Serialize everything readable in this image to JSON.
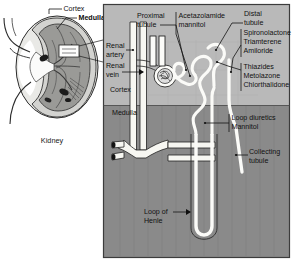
{
  "figure": {
    "type": "anatomical-diagram"
  },
  "kidney_panel": {
    "caption": "Kidney",
    "labels": {
      "cortex": "Cortex",
      "medulla": "Medulla"
    }
  },
  "nephron_panel": {
    "zones": {
      "cortex": "Cortex",
      "medulla": "Medulla"
    },
    "structures": {
      "proximal_tubule": "Proximal\ntubule",
      "proximal_tubule_line1": "Proximal",
      "proximal_tubule_line2": "tubule",
      "distal_tubule_line1": "Distal",
      "distal_tubule_line2": "tubule",
      "renal_artery_line1": "Renal",
      "renal_artery_line2": "artery",
      "renal_vein_line1": "Renal",
      "renal_vein_line2": "vein",
      "collecting_tubule_line1": "Collecting",
      "collecting_tubule_line2": "tubule",
      "loop_of_henle_line1": "Loop of",
      "loop_of_henle_line2": "Henle"
    },
    "drug_groups": [
      {
        "site": "proximal-tubule",
        "drugs": [
          "Acetazolamide",
          "mannitol"
        ],
        "line1": "Acetazolamide",
        "line2": "mannitol"
      },
      {
        "site": "collecting-duct",
        "drugs": [
          "Spironolactone",
          "Triamterene",
          "Amiloride"
        ],
        "line1": "Spironolactone",
        "line2": "Triamterene",
        "line3": "Amiloride"
      },
      {
        "site": "distal-tubule",
        "drugs": [
          "Thiazides",
          "Metolazone",
          "Chlorthalidone"
        ],
        "line1": "Thiazides",
        "line2": "Metolazone",
        "line3": "Chlorthalidone"
      },
      {
        "site": "loop-of-henle",
        "drugs": [
          "Loop diuretics",
          "Mannitol"
        ],
        "line1": "Loop diuretics",
        "line2": "Mannitol"
      }
    ]
  },
  "colors": {
    "cortex_fill": "#b9b9b9",
    "medulla_fill": "#8a8a8a",
    "panel_border": "#3c3c3c",
    "tubule_fill": "#fbfbf8",
    "text": "#111111",
    "page_background": "#ffffff"
  }
}
